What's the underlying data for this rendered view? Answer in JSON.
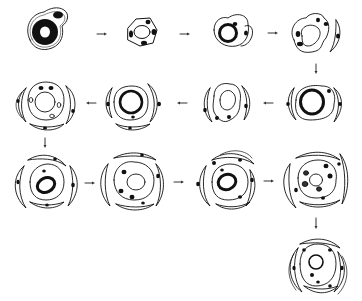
{
  "diagram": {
    "type": "developmental-sequence",
    "colors": {
      "ink": "#111111",
      "background": "#ffffff",
      "arrow": "#333333"
    },
    "stages": [
      {
        "id": 1,
        "row": 1,
        "cx": 44,
        "cy": 30,
        "kind": "single-cell-dark-nucleus"
      },
      {
        "id": 2,
        "row": 1,
        "cx": 141,
        "cy": 33,
        "kind": "cell-ring-with-satellites"
      },
      {
        "id": 3,
        "row": 1,
        "cx": 232,
        "cy": 33,
        "kind": "two-cells-ring-nucleus"
      },
      {
        "id": 4,
        "row": 1,
        "cx": 311,
        "cy": 35,
        "kind": "cell-with-crescent"
      },
      {
        "id": 5,
        "row": 2,
        "cx": 311,
        "cy": 104,
        "kind": "ring-nucleus-crescents"
      },
      {
        "id": 6,
        "row": 2,
        "cx": 225,
        "cy": 104,
        "kind": "irregular-cell-crescents"
      },
      {
        "id": 7,
        "row": 2,
        "cx": 130,
        "cy": 104,
        "kind": "ring-nucleus-crescents"
      },
      {
        "id": 8,
        "row": 2,
        "cx": 45,
        "cy": 105,
        "kind": "pale-nucleus-crescents"
      },
      {
        "id": 9,
        "row": 3,
        "cx": 45,
        "cy": 183,
        "kind": "oval-nucleus-layered"
      },
      {
        "id": 10,
        "row": 3,
        "cx": 133,
        "cy": 182,
        "kind": "pale-nucleus-layered"
      },
      {
        "id": 11,
        "row": 3,
        "cx": 228,
        "cy": 180,
        "kind": "oval-nucleus-layered"
      },
      {
        "id": 12,
        "row": 3,
        "cx": 316,
        "cy": 182,
        "kind": "pale-nucleus-layered"
      },
      {
        "id": 13,
        "row": 4,
        "cx": 316,
        "cy": 266,
        "kind": "oval-nucleus-layered"
      }
    ],
    "arrows": [
      {
        "from": 1,
        "to": 2,
        "direction": "right"
      },
      {
        "from": 2,
        "to": 3,
        "direction": "right"
      },
      {
        "from": 3,
        "to": 4,
        "direction": "right"
      },
      {
        "from": 4,
        "to": 5,
        "direction": "down"
      },
      {
        "from": 5,
        "to": 6,
        "direction": "left"
      },
      {
        "from": 6,
        "to": 7,
        "direction": "left"
      },
      {
        "from": 7,
        "to": 8,
        "direction": "left"
      },
      {
        "from": 8,
        "to": 9,
        "direction": "down"
      },
      {
        "from": 9,
        "to": 10,
        "direction": "right"
      },
      {
        "from": 10,
        "to": 11,
        "direction": "right"
      },
      {
        "from": 11,
        "to": 12,
        "direction": "right"
      },
      {
        "from": 12,
        "to": 13,
        "direction": "down"
      }
    ]
  }
}
